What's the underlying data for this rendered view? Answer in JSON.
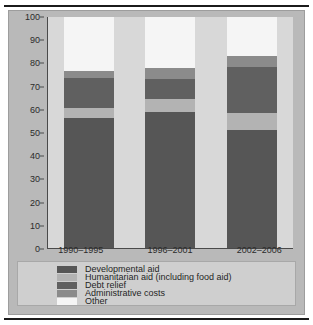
{
  "chart_data": {
    "type": "bar",
    "subtype": "stacked-bar-100-percent",
    "title": "",
    "xlabel": "",
    "ylabel": "",
    "ylim": [
      0,
      100
    ],
    "yticks": [
      0,
      10,
      20,
      30,
      40,
      50,
      60,
      70,
      80,
      90,
      100
    ],
    "grid": false,
    "legend_position": "bottom",
    "categories": [
      "1990–1995",
      "1996–2001",
      "2002–2006"
    ],
    "series": [
      {
        "name": "Developmental aid",
        "values": [
          56.5,
          59,
          51
        ],
        "color": "#565656"
      },
      {
        "name": "Humanitarian aid (including food aid)",
        "values": [
          4,
          5.5,
          7.5
        ],
        "color": "#b3b3b3"
      },
      {
        "name": "Debt relief",
        "values": [
          13,
          8.5,
          20
        ],
        "color": "#606060"
      },
      {
        "name": "Administrative costs",
        "values": [
          3,
          5,
          4.5
        ],
        "color": "#8b8b8b"
      },
      {
        "name": "Other",
        "values": [
          23.5,
          22,
          17
        ],
        "color": "#f5f5f5"
      }
    ]
  },
  "axis": {
    "y_ticks": [
      "100",
      "90",
      "80",
      "70",
      "60",
      "50",
      "40",
      "30",
      "20",
      "10",
      "0"
    ],
    "x_ticks": [
      "1990–1995",
      "1996–2001",
      "2002–2006"
    ]
  },
  "legend": {
    "items": [
      {
        "label": "Developmental aid",
        "color": "#565656"
      },
      {
        "label": "Humanitarian aid (including food aid)",
        "color": "#b3b3b3"
      },
      {
        "label": "Debt relief",
        "color": "#606060"
      },
      {
        "label": "Administrative costs",
        "color": "#8b8b8b"
      },
      {
        "label": "Other",
        "color": "#f5f5f5"
      }
    ]
  },
  "colors": {
    "figure_background": "#b9b9b9",
    "plot_background": "#d8d8d8",
    "legend_background": "#cfcfcf",
    "axis_line": "#4a4a4a",
    "text": "#2b2b2b",
    "rule": "#1b1b1b"
  }
}
